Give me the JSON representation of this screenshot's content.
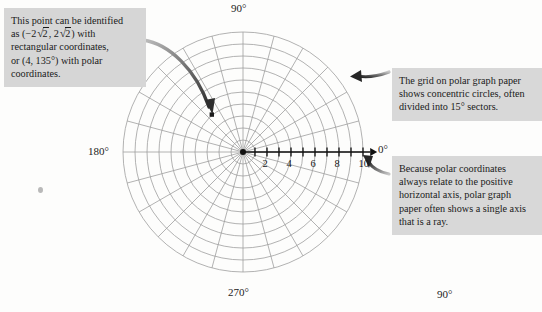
{
  "figure": {
    "type": "polar-graph-paper",
    "center": {
      "x": 243,
      "y": 152
    },
    "outer_radius_px": 120,
    "radial_sector_degrees": 15,
    "concentric_circle_count": 10,
    "axis": {
      "name": "polar-axis-ray",
      "direction_degrees": 0,
      "tick_labels": [
        "2",
        "4",
        "6",
        "8",
        "10"
      ],
      "tick_values": [
        2,
        4,
        6,
        8,
        10
      ],
      "minor_ticks": [
        1,
        2,
        3,
        4,
        5,
        6,
        7,
        8,
        9,
        10
      ],
      "max_value": 10
    },
    "angle_labels": {
      "top": "90°",
      "left": "180°",
      "right": "0°",
      "bottom": "270°",
      "bottom_right": "90°"
    },
    "plotted_point": {
      "label": "plotted-point",
      "rectangular": "(-2√2, 2√2)",
      "polar": "(4, 135°)",
      "r": 4,
      "theta_degrees": 135,
      "px": {
        "x": 212,
        "y": 115
      }
    }
  },
  "captions": {
    "point": {
      "name": "caption-point",
      "line1": "This point can be identified",
      "line2_prefix": "as (−2",
      "line2_rad1": "2",
      "line2_mid": ", 2",
      "line2_rad2": "2",
      "line2_suffix": ") with",
      "line3": "rectangular coordinates,",
      "line4": "or (4, 135°) with polar",
      "line5": "coordinates.",
      "full_text": "This point can be identified as (−2√2, 2√2) with rectangular coordinates, or (4, 135°) with polar coordinates."
    },
    "grid": {
      "name": "caption-grid",
      "full_text": "The grid on polar graph paper shows concentric circles, often divided into 15° sectors."
    },
    "ray": {
      "name": "caption-ray",
      "full_text": "Because polar coordinates always relate to the positive horizontal axis, polar graph paper often shows a single axis that is a ray."
    }
  },
  "colors": {
    "page_background": "#fdfdfc",
    "caption_background": "#d6d6d6",
    "grid_line": "#9a9a9a",
    "axis_line": "#111111",
    "text": "#1a1a1a",
    "arrow": "#3a3a3a"
  },
  "annotations": {
    "arrow_to_point": "curved-arrow-to-plotted-point",
    "arrow_to_grid": "curved-arrow-to-grid",
    "arrow_to_ray": "curved-arrow-to-axis-ray"
  }
}
